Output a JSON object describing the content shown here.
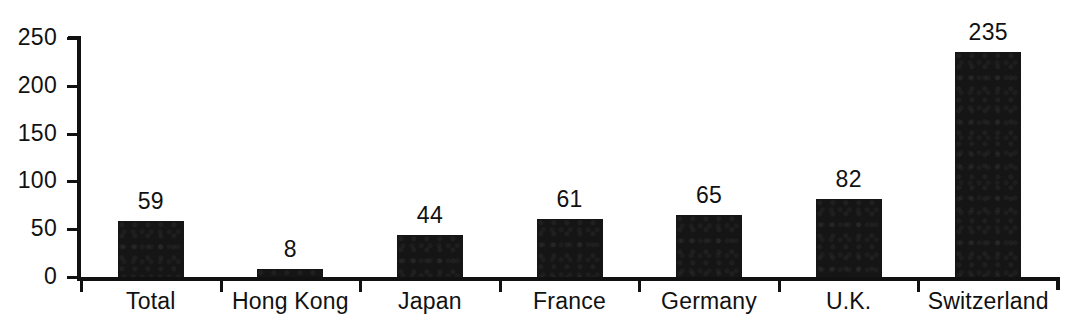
{
  "chart_data": {
    "type": "bar",
    "title": "",
    "subtitle": "",
    "xlabel": "",
    "ylabel": "",
    "categories": [
      "Total",
      "Hong Kong",
      "Japan",
      "France",
      "Germany",
      "U.K.",
      "Switzerland"
    ],
    "values": [
      59,
      8,
      44,
      61,
      65,
      82,
      235
    ],
    "value_labels": [
      "59",
      "8",
      "44",
      "61",
      "65",
      "82",
      "235"
    ],
    "ylim": [
      0,
      250
    ],
    "yticks": [
      0,
      50,
      100,
      150,
      200,
      250
    ],
    "ytick_labels": [
      "0",
      "50",
      "100",
      "150",
      "200",
      "250"
    ],
    "grid": false,
    "legend": false,
    "legend_position": "none",
    "series": [
      {
        "name": "",
        "values": [
          59,
          8,
          44,
          61,
          65,
          82,
          235
        ],
        "color": "#151515"
      }
    ],
    "colors": {
      "bar": "#151515",
      "axis": "#111111",
      "text": "#111111",
      "background": "#ffffff"
    }
  }
}
